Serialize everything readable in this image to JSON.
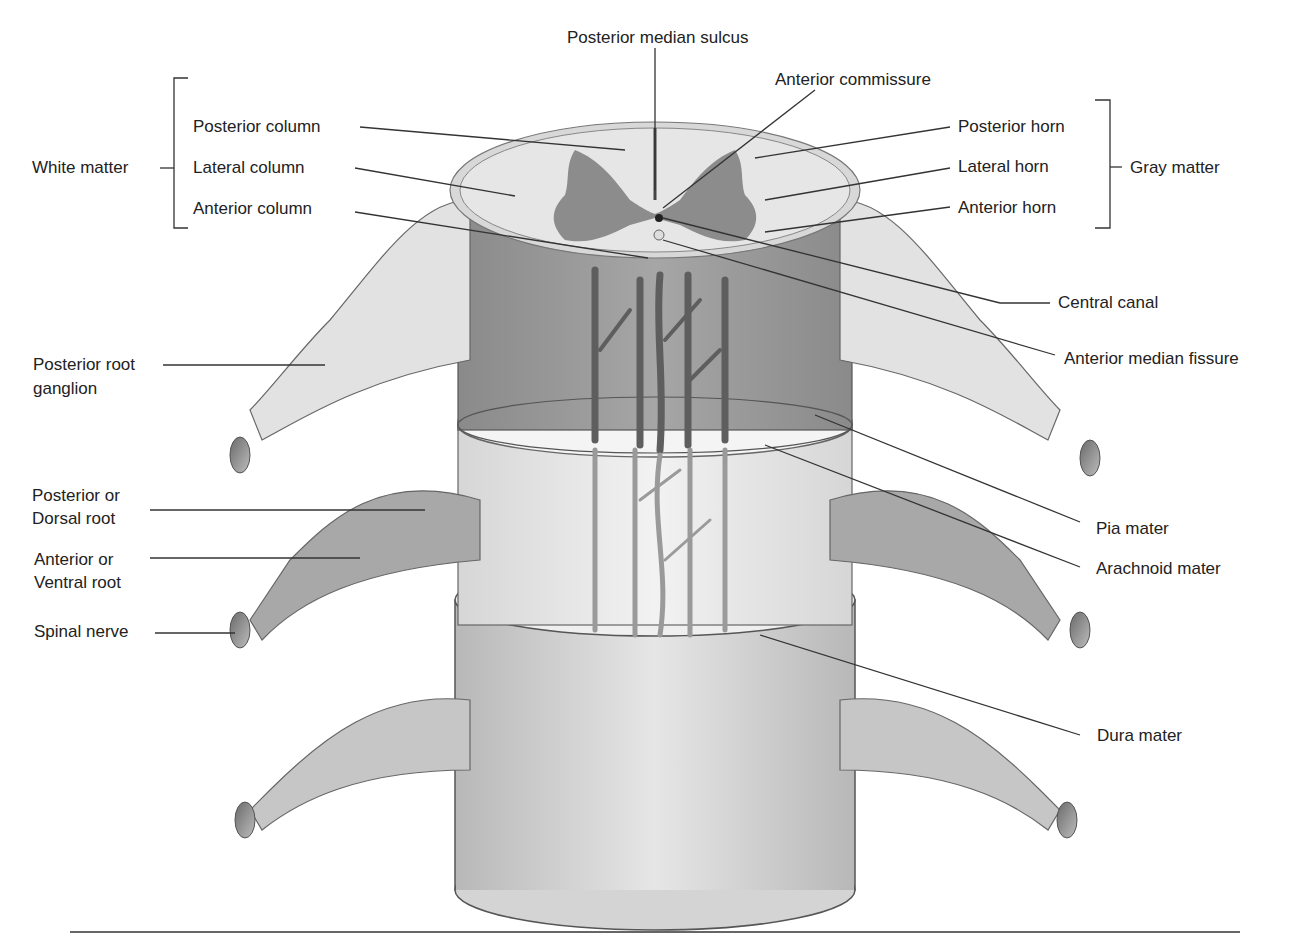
{
  "diagram": {
    "colors": {
      "white_matter": "#e4e4e4",
      "gray_matter": "#8c8c8c",
      "cord_body": "#9a9a9a",
      "arachnoid_layer": "#eeeeee",
      "dura_layer": "#dadada",
      "nerve": "#d0d0d0",
      "vessel": "#6e6e6e",
      "line": "#333333"
    },
    "labels": {
      "posterior_median_sulcus": "Posterior median sulcus",
      "anterior_commissure": "Anterior commissure",
      "white_matter": "White matter",
      "posterior_column": "Posterior column",
      "lateral_column": "Lateral column",
      "anterior_column": "Anterior column",
      "gray_matter": "Gray matter",
      "posterior_horn": "Posterior horn",
      "lateral_horn": "Lateral horn",
      "anterior_horn": "Anterior horn",
      "central_canal": "Central canal",
      "anterior_median_fissure": "Anterior median fissure",
      "posterior_root_ganglion_line1": "Posterior root",
      "posterior_root_ganglion_line2": "ganglion",
      "posterior_dorsal_root_line1": "Posterior or",
      "posterior_dorsal_root_line2": "Dorsal root",
      "anterior_ventral_root_line1": "Anterior or",
      "anterior_ventral_root_line2": "Ventral root",
      "spinal_nerve": "Spinal nerve",
      "pia_mater": "Pia mater",
      "arachnoid_mater": "Arachnoid mater",
      "dura_mater": "Dura mater"
    }
  }
}
